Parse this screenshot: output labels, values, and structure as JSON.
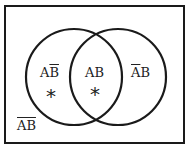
{
  "diagram": {
    "type": "venn",
    "universe_label": {
      "plain": "",
      "overlined": "AB"
    },
    "regions": [
      {
        "id": "a-not-b",
        "plain": "A",
        "overlined": "B",
        "marked": true
      },
      {
        "id": "a-and-b",
        "plain": "AB",
        "overlined": "",
        "marked": true
      },
      {
        "id": "not-a-b",
        "plain": "B",
        "overlined": "A",
        "marked": false
      }
    ],
    "marker": "*",
    "colors": {
      "stroke": "#1a1a1a",
      "text": "#222222",
      "background": "#ffffff"
    }
  }
}
